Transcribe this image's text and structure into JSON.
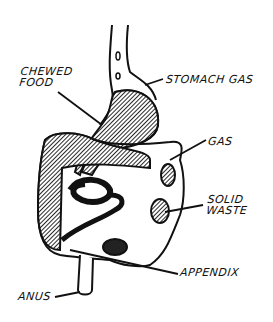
{
  "diagram": {
    "labels": {
      "chewed_food": "CHEWED\nFOOD",
      "stomach_gas": "STOMACH GAS",
      "gas": "GAS",
      "solid_waste": "SOLID\nWASTE",
      "appendix": "APPENDIX",
      "anus": "ANUS"
    }
  }
}
